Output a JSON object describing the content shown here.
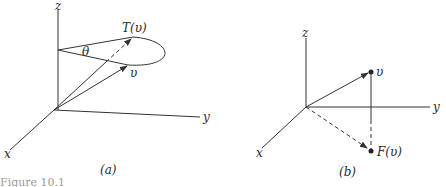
{
  "figure": {
    "caption_fragment": "Figure 10.1",
    "panels": [
      {
        "id": "a",
        "caption": "(a)",
        "axes": {
          "x": "x",
          "y": "y",
          "z": "z"
        },
        "labels": {
          "vector": "υ",
          "image": "T(υ)",
          "angle": "θ"
        },
        "description": "Rotation of vector υ about the z-axis by angle θ giving T(υ)"
      },
      {
        "id": "b",
        "caption": "(b)",
        "axes": {
          "x": "x",
          "y": "y",
          "z": "z"
        },
        "labels": {
          "vector": "υ",
          "image": "F(υ)"
        },
        "description": "Projection of vector υ onto the xy-plane giving F(υ)"
      }
    ]
  }
}
